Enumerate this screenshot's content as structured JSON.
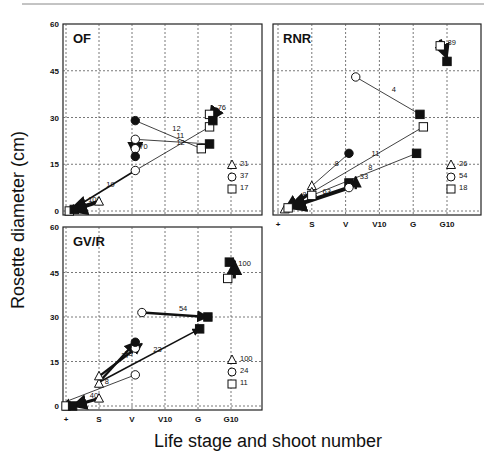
{
  "figure": {
    "ylabel": "Rosette diameter (cm)",
    "xlabel": "Life stage and shoot number",
    "x_ticks": [
      "+",
      "S",
      "V",
      "V10",
      "G",
      "G10"
    ],
    "y_ticks": [
      0,
      15,
      30,
      45,
      60
    ]
  },
  "chart_data": [
    {
      "type": "scatter",
      "title": "OF",
      "xlabel": "Life stage and shoot number",
      "ylabel": "Rosette diameter (cm)",
      "categories": [
        "+",
        "S",
        "V",
        "V10",
        "G",
        "G10"
      ],
      "ylim": [
        0,
        60
      ],
      "grid": true,
      "legend": [
        {
          "symbol": "triangle",
          "label": "21"
        },
        {
          "symbol": "circle",
          "label": "37"
        },
        {
          "symbol": "square",
          "label": "17"
        }
      ],
      "points": [
        {
          "x": 0.1,
          "y": 0,
          "shape": "square",
          "fill": "open"
        },
        {
          "x": 0.25,
          "y": 0.5,
          "shape": "square",
          "fill": "filled"
        },
        {
          "x": 1.0,
          "y": 3,
          "shape": "triangle",
          "fill": "open"
        },
        {
          "x": 2.1,
          "y": 13,
          "shape": "circle",
          "fill": "open"
        },
        {
          "x": 2.1,
          "y": 20,
          "shape": "circle",
          "fill": "open"
        },
        {
          "x": 2.1,
          "y": 17.5,
          "shape": "circle",
          "fill": "filled"
        },
        {
          "x": 2.1,
          "y": 23,
          "shape": "circle",
          "fill": "open"
        },
        {
          "x": 2.1,
          "y": 29,
          "shape": "circle",
          "fill": "filled"
        },
        {
          "x": 4.1,
          "y": 20,
          "shape": "square",
          "fill": "open"
        },
        {
          "x": 4.35,
          "y": 21.5,
          "shape": "square",
          "fill": "filled"
        },
        {
          "x": 4.35,
          "y": 27,
          "shape": "square",
          "fill": "open"
        },
        {
          "x": 4.35,
          "y": 31,
          "shape": "square",
          "fill": "open"
        },
        {
          "x": 4.45,
          "y": 29,
          "shape": "square",
          "fill": "filled"
        }
      ],
      "arrows": [
        {
          "from": [
            1.0,
            3
          ],
          "to": [
            0.1,
            0
          ],
          "label": "100",
          "weight": 5
        },
        {
          "from": [
            2.1,
            13
          ],
          "to": [
            0.1,
            0
          ],
          "label": "19",
          "weight": 2
        },
        {
          "from": [
            2.1,
            13
          ],
          "to": [
            4.35,
            27
          ],
          "label": "12",
          "weight": 1
        },
        {
          "from": [
            2.1,
            23
          ],
          "to": [
            4.35,
            21.5
          ],
          "label": "11",
          "weight": 1
        },
        {
          "from": [
            4.1,
            20
          ],
          "to": [
            2.1,
            29
          ],
          "label": "12",
          "weight": 1
        },
        {
          "from": [
            2.1,
            20
          ],
          "to": [
            2.1,
            17.5
          ],
          "label": "70",
          "weight": 4
        },
        {
          "from": [
            4.6,
            33
          ],
          "to": [
            4.35,
            29
          ],
          "label": "76",
          "weight": 4
        }
      ]
    },
    {
      "type": "scatter",
      "title": "RNR",
      "xlabel": "Life stage and shoot number",
      "ylabel": "Rosette diameter (cm)",
      "categories": [
        "+",
        "S",
        "V",
        "V10",
        "G",
        "G10"
      ],
      "ylim": [
        0,
        60
      ],
      "grid": true,
      "legend": [
        {
          "symbol": "triangle",
          "label": "26"
        },
        {
          "symbol": "circle",
          "label": "54"
        },
        {
          "symbol": "square",
          "label": "18"
        }
      ],
      "points": [
        {
          "x": 0.2,
          "y": 0.5,
          "shape": "triangle",
          "fill": "open"
        },
        {
          "x": 0.3,
          "y": 1,
          "shape": "square",
          "fill": "open"
        },
        {
          "x": 1.0,
          "y": 8,
          "shape": "triangle",
          "fill": "open"
        },
        {
          "x": 1.0,
          "y": 6,
          "shape": "triangle",
          "fill": "open"
        },
        {
          "x": 1.0,
          "y": 5,
          "shape": "square",
          "fill": "open"
        },
        {
          "x": 2.1,
          "y": 18.5,
          "shape": "circle",
          "fill": "filled"
        },
        {
          "x": 2.1,
          "y": 9,
          "shape": "square",
          "fill": "filled"
        },
        {
          "x": 2.1,
          "y": 7.5,
          "shape": "circle",
          "fill": "open"
        },
        {
          "x": 2.3,
          "y": 43,
          "shape": "circle",
          "fill": "open"
        },
        {
          "x": 4.1,
          "y": 18.5,
          "shape": "square",
          "fill": "filled"
        },
        {
          "x": 4.2,
          "y": 31,
          "shape": "square",
          "fill": "filled"
        },
        {
          "x": 4.3,
          "y": 27,
          "shape": "square",
          "fill": "open"
        },
        {
          "x": 4.8,
          "y": 53,
          "shape": "square",
          "fill": "open"
        },
        {
          "x": 5.0,
          "y": 48,
          "shape": "square",
          "fill": "filled"
        }
      ],
      "arrows": [
        {
          "from": [
            1.0,
            6
          ],
          "to": [
            0.2,
            0.5
          ],
          "label": "84",
          "weight": 4
        },
        {
          "from": [
            2.1,
            7.5
          ],
          "to": [
            0.3,
            1
          ],
          "label": "63",
          "weight": 5
        },
        {
          "from": [
            1.0,
            8
          ],
          "to": [
            2.1,
            18.5
          ],
          "label": "8",
          "weight": 1
        },
        {
          "from": [
            1.0,
            6
          ],
          "to": [
            4.3,
            27
          ],
          "label": "11",
          "weight": 1
        },
        {
          "from": [
            1.0,
            5
          ],
          "to": [
            4.1,
            18.5
          ],
          "label": "8",
          "weight": 1
        },
        {
          "from": [
            2.3,
            43
          ],
          "to": [
            4.2,
            31
          ],
          "label": "4",
          "weight": 1
        },
        {
          "from": [
            2.3,
            7
          ],
          "to": [
            2.3,
            11
          ],
          "label": "33",
          "weight": 3
        },
        {
          "from": [
            4.8,
            55
          ],
          "to": [
            5.0,
            49
          ],
          "label": "89",
          "weight": 4
        }
      ]
    },
    {
      "type": "scatter",
      "title": "GV/R",
      "xlabel": "Life stage and shoot number",
      "ylabel": "Rosette diameter (cm)",
      "categories": [
        "+",
        "S",
        "V",
        "V10",
        "G",
        "G10"
      ],
      "ylim": [
        0,
        60
      ],
      "grid": true,
      "legend": [
        {
          "symbol": "triangle",
          "label": "100"
        },
        {
          "symbol": "circle",
          "label": "24"
        },
        {
          "symbol": "square",
          "label": "11"
        }
      ],
      "points": [
        {
          "x": 0.0,
          "y": 0,
          "shape": "square",
          "fill": "open"
        },
        {
          "x": 0.2,
          "y": 0,
          "shape": "square",
          "fill": "filled"
        },
        {
          "x": 1.0,
          "y": 2.5,
          "shape": "triangle",
          "fill": "open"
        },
        {
          "x": 1.0,
          "y": 7.5,
          "shape": "triangle",
          "fill": "open"
        },
        {
          "x": 1.0,
          "y": 10,
          "shape": "triangle",
          "fill": "open"
        },
        {
          "x": 2.1,
          "y": 10.5,
          "shape": "circle",
          "fill": "open"
        },
        {
          "x": 2.1,
          "y": 19.5,
          "shape": "circle",
          "fill": "open"
        },
        {
          "x": 2.1,
          "y": 21.5,
          "shape": "circle",
          "fill": "filled"
        },
        {
          "x": 2.3,
          "y": 31.5,
          "shape": "circle",
          "fill": "open"
        },
        {
          "x": 4.05,
          "y": 26,
          "shape": "square",
          "fill": "filled"
        },
        {
          "x": 4.3,
          "y": 30,
          "shape": "square",
          "fill": "filled"
        },
        {
          "x": 4.9,
          "y": 43,
          "shape": "square",
          "fill": "open"
        },
        {
          "x": 4.95,
          "y": 48.5,
          "shape": "square",
          "fill": "filled"
        }
      ],
      "arrows": [
        {
          "from": [
            1.0,
            2.5
          ],
          "to": [
            0.2,
            0
          ],
          "label": "40",
          "weight": 4
        },
        {
          "from": [
            2.1,
            10.5
          ],
          "to": [
            0.0,
            1.5
          ],
          "label": "8",
          "weight": 1
        },
        {
          "from": [
            1.0,
            8
          ],
          "to": [
            2.1,
            21.5
          ],
          "label": "37",
          "weight": 3
        },
        {
          "from": [
            1.0,
            10
          ],
          "to": [
            2.3,
            21
          ],
          "label": "38",
          "weight": 3
        },
        {
          "from": [
            1.0,
            8
          ],
          "to": [
            4.05,
            26
          ],
          "label": "23",
          "weight": 2
        },
        {
          "from": [
            2.3,
            31.5
          ],
          "to": [
            4.3,
            30
          ],
          "label": "54",
          "weight": 3
        },
        {
          "from": [
            5.1,
            43
          ],
          "to": [
            5.1,
            49
          ],
          "label": "100",
          "weight": 4
        }
      ]
    }
  ]
}
